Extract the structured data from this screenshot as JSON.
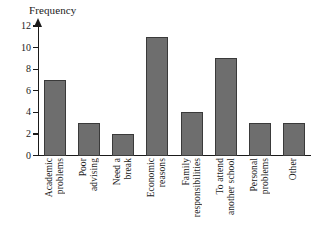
{
  "chart_data": {
    "type": "bar",
    "title": "",
    "subtitle": "",
    "xlabel": "",
    "ylabel": "Frequency",
    "ylim": [
      0,
      12
    ],
    "grid": false,
    "legend": null,
    "y_ticks": [
      0,
      2,
      4,
      6,
      8,
      10,
      12
    ],
    "y_tick_labels": [
      "0",
      "2",
      "4",
      "6",
      "8",
      "10",
      "12"
    ],
    "categories": [
      "Academic problems",
      "Poor advising",
      "Need a break",
      "Economic reasons",
      "Family responsibilities",
      "To attend another school",
      "Personal problems",
      "Other"
    ],
    "category_lines": [
      [
        "Academic",
        "problems"
      ],
      [
        "Poor",
        "advising"
      ],
      [
        "Need a",
        "break"
      ],
      [
        "Economic",
        "reasons"
      ],
      [
        "Family",
        "responsibilities"
      ],
      [
        "To attend",
        "another school"
      ],
      [
        "Personal",
        "problems"
      ],
      [
        "Other"
      ]
    ],
    "values": [
      7,
      3,
      2,
      11,
      4,
      9,
      3,
      3
    ],
    "bar_color": "#6e6e6e",
    "bar_edge_color": "#3a3a3a",
    "axis_color": "#1a1a1a",
    "background_color": "#ffffff",
    "label_rotation": 90
  }
}
